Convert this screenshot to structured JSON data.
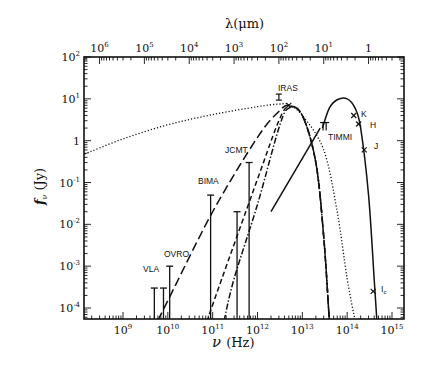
{
  "chart_data": {
    "type": "line",
    "title": "",
    "xlabel": "ν (Hz)",
    "ylabel": "f_ν (Jy)",
    "x2label": "λ(μm)",
    "xscale": "log",
    "yscale": "log",
    "xlim": [
      100000000.0,
      2000000000000000.0
    ],
    "ylim": [
      5e-05,
      100
    ],
    "grid": false,
    "legend": null,
    "x_ticks": [
      {
        "label": "10",
        "exp": "9",
        "value": 1000000000.0
      },
      {
        "label": "10",
        "exp": "10",
        "value": 10000000000.0
      },
      {
        "label": "10",
        "exp": "11",
        "value": 100000000000.0
      },
      {
        "label": "10",
        "exp": "12",
        "value": 1000000000000.0
      },
      {
        "label": "10",
        "exp": "13",
        "value": 10000000000000.0
      },
      {
        "label": "10",
        "exp": "14",
        "value": 100000000000000.0
      },
      {
        "label": "10",
        "exp": "15",
        "value": 1000000000000000.0
      }
    ],
    "x2_ticks": [
      {
        "label": "10",
        "exp": "6",
        "value_um": 1000000.0
      },
      {
        "label": "10",
        "exp": "5",
        "value_um": 100000.0
      },
      {
        "label": "10",
        "exp": "4",
        "value_um": 10000.0
      },
      {
        "label": "10",
        "exp": "3",
        "value_um": 1000.0
      },
      {
        "label": "10",
        "exp": "2",
        "value_um": 100.0
      },
      {
        "label": "10",
        "exp": "1",
        "value_um": 10
      },
      {
        "label": "1",
        "exp": "",
        "value_um": 1
      }
    ],
    "y_ticks": [
      {
        "label": "10",
        "exp": "2",
        "value": 100
      },
      {
        "label": "10",
        "exp": "1",
        "value": 10
      },
      {
        "label": "1",
        "exp": "",
        "value": 1
      },
      {
        "label": "10",
        "exp": "-1",
        "value": 0.1
      },
      {
        "label": "10",
        "exp": "-2",
        "value": 0.01
      },
      {
        "label": "10",
        "exp": "-3",
        "value": 0.001
      },
      {
        "label": "10",
        "exp": "-4",
        "value": 0.0001
      }
    ],
    "upper_limits": [
      {
        "instrument": "VLA",
        "nu": 5000000000.0,
        "flux": 0.0003
      },
      {
        "instrument": "VLA",
        "nu": 8000000000.0,
        "flux": 0.0003
      },
      {
        "instrument": "OVRO",
        "nu": 11000000000.0,
        "flux": 0.001
      },
      {
        "instrument": "BIMA",
        "nu": 90000000000.0,
        "flux": 0.05
      },
      {
        "instrument": "JCMT",
        "nu": 350000000000.0,
        "flux": 0.02
      },
      {
        "instrument": "JCMT",
        "nu": 650000000000.0,
        "flux": 0.3
      }
    ],
    "detections": [
      {
        "instrument": "IRAS",
        "nu": 3000000000000.0,
        "flux": 11
      },
      {
        "instrument": "IRAS",
        "nu": 5000000000000.0,
        "flux": 7
      },
      {
        "instrument": "TIMMI",
        "nu": 29000000000000.0,
        "flux": 2.3
      },
      {
        "instrument": "TIMMI",
        "nu": 34000000000000.0,
        "flux": 2.3
      },
      {
        "instrument": "K",
        "nu": 140000000000000.0,
        "flux": 4
      },
      {
        "instrument": "H",
        "nu": 180000000000000.0,
        "flux": 2.5
      },
      {
        "instrument": "J",
        "nu": 240000000000000.0,
        "flux": 0.6
      },
      {
        "instrument": "Ic",
        "nu": 380000000000000.0,
        "flux": 0.00025
      }
    ],
    "series": [
      {
        "name": "long-dashed model",
        "style": "long-dash",
        "x": [
          6000000000.0,
          10000000000.0,
          100000000000.0,
          1000000000000.0,
          3000000000000.0,
          5000000000000.0,
          10000000000000.0,
          20000000000000.0,
          30000000000000.0,
          40000000000000.0
        ],
        "y": [
          5e-05,
          0.00015,
          0.02,
          1.2,
          5,
          7,
          4,
          0.3,
          0.005,
          5e-05
        ]
      },
      {
        "name": "short-dashed model",
        "style": "short-dash",
        "x": [
          80000000000.0,
          100000000000.0,
          1000000000000.0,
          3000000000000.0,
          5000000000000.0,
          10000000000000.0,
          20000000000000.0,
          30000000000000.0,
          40000000000000.0
        ],
        "y": [
          5e-05,
          0.00012,
          0.12,
          3,
          6.5,
          4,
          0.3,
          0.005,
          5e-05
        ]
      },
      {
        "name": "dash-dot model",
        "style": "dash-dot",
        "x": [
          180000000000.0,
          300000000000.0,
          1000000000000.0,
          3000000000000.0,
          5000000000000.0,
          10000000000000.0,
          20000000000000.0,
          30000000000000.0,
          40000000000000.0
        ],
        "y": [
          5e-05,
          0.0005,
          0.03,
          2,
          6,
          4,
          0.3,
          0.005,
          5e-05
        ]
      },
      {
        "name": "dotted model",
        "style": "dotted",
        "x": [
          120000000.0,
          1000000000.0,
          10000000000.0,
          100000000000.0,
          1000000000000.0,
          3000000000000.0,
          5000000000000.0,
          10000000000000.0,
          30000000000000.0,
          60000000000000.0,
          100000000000000.0,
          150000000000000.0
        ],
        "y": [
          0.45,
          1.1,
          2.4,
          4.2,
          6.5,
          7.5,
          7.2,
          4,
          0.6,
          0.02,
          0.0005,
          5e-05
        ]
      },
      {
        "name": "solid stellar model",
        "style": "solid",
        "x": [
          28000000000000.0,
          40000000000000.0,
          60000000000000.0,
          100000000000000.0,
          150000000000000.0,
          200000000000000.0,
          300000000000000.0,
          400000000000000.0,
          460000000000000.0
        ],
        "y": [
          2,
          6,
          9.5,
          10,
          6,
          2,
          0.05,
          0.0005,
          5e-05
        ]
      },
      {
        "name": "solid line",
        "style": "solid",
        "x": [
          2000000000000.0,
          25000000000000.0
        ],
        "y": [
          0.02,
          2
        ]
      }
    ],
    "annotations": [
      "VLA",
      "OVRO",
      "BIMA",
      "JCMT",
      "IRAS",
      "TIMMI",
      "K",
      "H",
      "J",
      "Ic"
    ]
  },
  "labels": {
    "xlabel_symbol": "ν",
    "xlabel_unit": "(Hz)",
    "ylabel_symbol": "f",
    "ylabel_sub": "ν",
    "ylabel_unit": "(Jy)",
    "x2label": "λ(μm)",
    "inst_vla": "VLA",
    "inst_ovro": "OVRO",
    "inst_bima": "BIMA",
    "inst_jcmt": "JCMT",
    "inst_iras": "IRAS",
    "inst_timmi": "TIMMI",
    "band_k": "K",
    "band_h": "H",
    "band_j": "J",
    "band_ic": "I",
    "band_ic_sub": "c"
  }
}
